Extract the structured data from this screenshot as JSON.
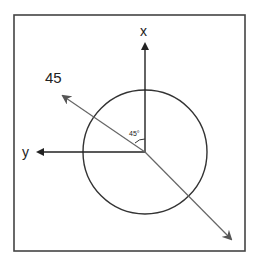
{
  "diagram": {
    "labels": {
      "x_axis": "x",
      "y_axis": "y",
      "diagonal": "45",
      "angle": "45°"
    },
    "colors": {
      "frame": "#444444",
      "axes": "#222222",
      "diagonal": "#666666",
      "circle": "#333333",
      "background": "#ffffff"
    }
  }
}
